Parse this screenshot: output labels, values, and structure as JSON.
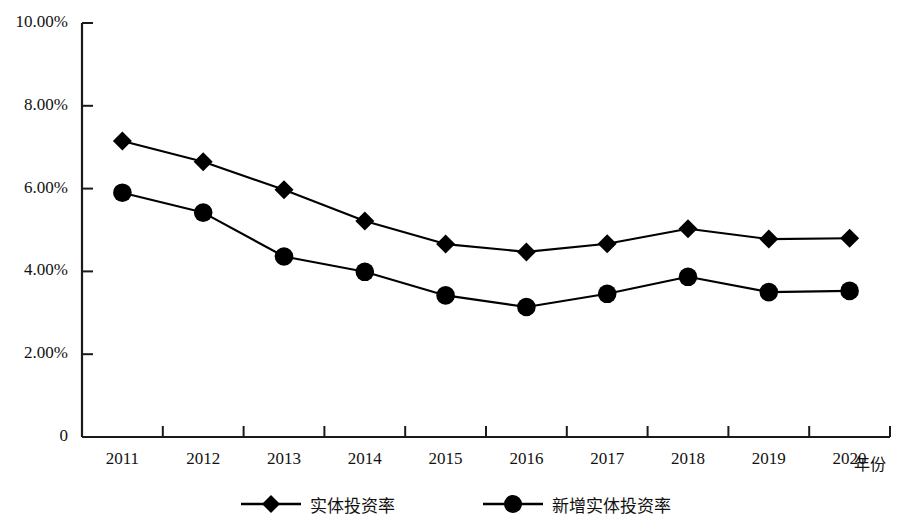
{
  "chart_data": {
    "type": "line",
    "title": "",
    "xlabel": "年份",
    "ylabel": "",
    "grid": false,
    "legend_position": "bottom",
    "categories": [
      "2011",
      "2012",
      "2013",
      "2014",
      "2015",
      "2016",
      "2017",
      "2018",
      "2019",
      "2020"
    ],
    "ylim": [
      0,
      10
    ],
    "ytick_labels": [
      "10.00%",
      "8.00%",
      "6.00%",
      "4.00%",
      "2.00%",
      "0"
    ],
    "ytick_values": [
      10,
      8,
      6,
      4,
      2,
      0
    ],
    "series": [
      {
        "name": "实体投资率",
        "marker": "diamond",
        "color": "#000000",
        "values": [
          7.15,
          6.65,
          5.97,
          5.22,
          4.66,
          4.47,
          4.67,
          5.03,
          4.78,
          4.8
        ]
      },
      {
        "name": "新增实体投资率",
        "marker": "circle",
        "color": "#000000",
        "values": [
          5.9,
          5.42,
          4.36,
          3.99,
          3.42,
          3.14,
          3.46,
          3.87,
          3.5,
          3.53
        ]
      }
    ]
  },
  "axis": {
    "x_axis_title": "年份"
  },
  "legend": {
    "items": [
      {
        "label": "实体投资率",
        "marker": "diamond-marker-icon"
      },
      {
        "label": "新增实体投资率",
        "marker": "circle-marker-icon"
      }
    ]
  }
}
